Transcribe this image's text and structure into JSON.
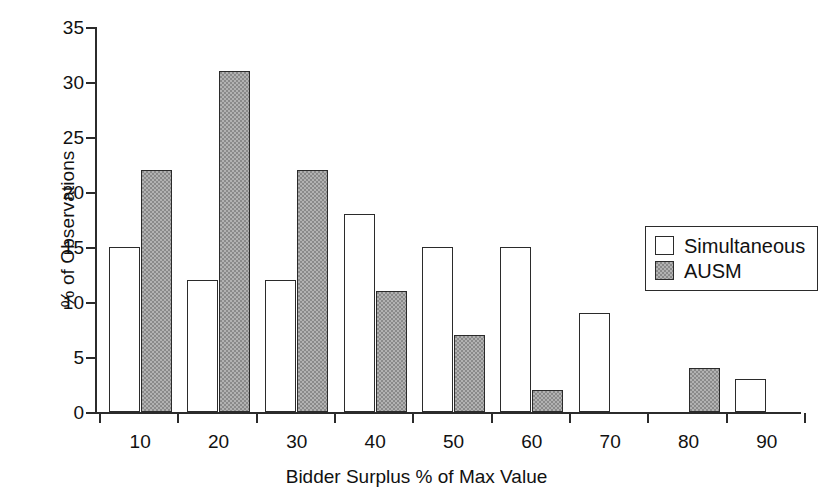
{
  "chart_data": {
    "type": "bar",
    "title": "",
    "xlabel": "Bidder Surplus % of Max Value",
    "ylabel": "% of Observations",
    "categories": [
      "10",
      "20",
      "30",
      "40",
      "50",
      "60",
      "70",
      "80",
      "90"
    ],
    "series": [
      {
        "name": "Simultaneous",
        "color": "#ffffff",
        "values": [
          15,
          12,
          12,
          18,
          15,
          15,
          9,
          0,
          3
        ]
      },
      {
        "name": "AUSM",
        "color": "#8a8a8a",
        "values": [
          22,
          31,
          22,
          11,
          7,
          2,
          0,
          4,
          0
        ]
      }
    ],
    "ylim": [
      0,
      35
    ],
    "ytick_values": [
      0,
      5,
      10,
      15,
      20,
      25,
      30,
      35
    ],
    "ytick_labels": [
      "0",
      "5",
      "10",
      "15",
      "20",
      "25",
      "30",
      "35"
    ],
    "grid": false,
    "legend_position": "upper-right",
    "legend_entries": [
      "Simultaneous",
      "AUSM"
    ]
  }
}
